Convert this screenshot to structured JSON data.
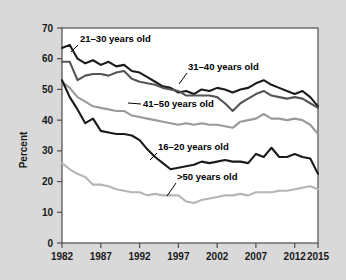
{
  "chart_data": {
    "type": "line",
    "title": "",
    "subtitle": "",
    "xlabel": "",
    "ylabel": "Percent",
    "xlim": [
      1982,
      2015
    ],
    "ylim": [
      0,
      70
    ],
    "ytick_labels": [
      "0",
      "10",
      "20",
      "30",
      "40",
      "50",
      "60",
      "70"
    ],
    "ytick_values": [
      0,
      10,
      20,
      30,
      40,
      50,
      60,
      70
    ],
    "xtick_labels": [
      "1982",
      "1987",
      "1992",
      "1997",
      "2002",
      "2007",
      "2012",
      "2015"
    ],
    "xtick_values": [
      1982,
      1987,
      1992,
      1997,
      2002,
      2007,
      2012,
      2015
    ],
    "grid": false,
    "legend": "inline-annotations",
    "x": [
      1982,
      1983,
      1984,
      1985,
      1986,
      1987,
      1988,
      1989,
      1990,
      1991,
      1992,
      1993,
      1994,
      1995,
      1996,
      1997,
      1998,
      1999,
      2000,
      2001,
      2002,
      2003,
      2004,
      2005,
      2006,
      2007,
      2008,
      2009,
      2010,
      2011,
      2012,
      2013,
      2014,
      2015
    ],
    "series": [
      {
        "name": "21-30 years old",
        "label": "21–30 years old",
        "color": "#1a1a1a",
        "values": [
          63.5,
          64.5,
          60.0,
          58.5,
          59.5,
          58.0,
          59.0,
          57.5,
          58.0,
          56.0,
          55.5,
          54.0,
          52.5,
          51.0,
          50.5,
          49.0,
          49.5,
          48.5,
          50.0,
          49.5,
          50.5,
          50.0,
          49.0,
          50.0,
          50.5,
          52.0,
          53.0,
          51.5,
          50.5,
          49.5,
          48.5,
          49.5,
          47.5,
          44.5
        ]
      },
      {
        "name": "31-40 years old",
        "label": "31–40 years old",
        "color": "#555555",
        "values": [
          59.0,
          59.0,
          53.0,
          54.5,
          55.0,
          55.0,
          54.5,
          55.5,
          56.0,
          53.5,
          52.5,
          52.0,
          51.5,
          50.5,
          50.0,
          49.5,
          48.0,
          48.0,
          48.0,
          48.0,
          47.5,
          45.5,
          43.0,
          45.5,
          47.0,
          48.5,
          49.5,
          48.0,
          47.5,
          47.0,
          47.5,
          47.0,
          45.5,
          44.0
        ]
      },
      {
        "name": "41-50 years old",
        "label": "41–50 years old",
        "color": "#9a9a9a",
        "values": [
          52.5,
          50.5,
          47.5,
          46.0,
          44.5,
          44.0,
          43.5,
          43.0,
          43.0,
          41.5,
          41.0,
          40.5,
          40.0,
          39.5,
          39.0,
          38.5,
          39.0,
          38.5,
          39.0,
          38.5,
          38.5,
          38.0,
          37.5,
          39.5,
          40.0,
          40.5,
          42.0,
          40.5,
          40.5,
          40.0,
          40.5,
          40.0,
          38.5,
          35.5
        ]
      },
      {
        "name": "16-20 years old",
        "label": "16–20 years old",
        "color": "#1a1a1a",
        "values": [
          53.0,
          47.5,
          43.5,
          39.0,
          40.5,
          36.5,
          36.0,
          35.5,
          35.5,
          35.0,
          33.5,
          30.5,
          28.0,
          26.0,
          24.0,
          24.5,
          25.0,
          25.5,
          26.5,
          26.0,
          26.5,
          27.0,
          26.5,
          26.5,
          26.0,
          29.0,
          28.0,
          31.0,
          28.0,
          28.0,
          29.0,
          28.0,
          27.5,
          22.5
        ]
      },
      {
        "name": ">50 years old",
        "label": ">50 years old",
        "color": "#b5b5b5",
        "values": [
          26.0,
          24.0,
          22.5,
          21.5,
          19.0,
          19.0,
          18.5,
          17.5,
          17.0,
          16.5,
          16.5,
          15.5,
          16.0,
          15.5,
          15.5,
          15.5,
          13.5,
          13.0,
          14.0,
          14.5,
          15.0,
          15.5,
          15.5,
          16.0,
          15.5,
          16.5,
          16.5,
          16.5,
          17.0,
          17.0,
          17.5,
          18.0,
          18.5,
          17.5
        ]
      }
    ],
    "annotations": [
      {
        "name": "annotation-21-30",
        "text": "21–30 years old",
        "text_x": 80,
        "text_y": 42,
        "leader": [
          [
            78,
            45
          ],
          [
            71,
            52
          ]
        ]
      },
      {
        "name": "annotation-31-40",
        "text": "31–40 years old",
        "text_x": 188,
        "text_y": 70,
        "leader": [
          [
            187,
            73
          ],
          [
            179,
            84
          ]
        ]
      },
      {
        "name": "annotation-41-50",
        "text": "41–50 years old",
        "text_x": 143,
        "text_y": 107,
        "leader": [
          [
            141,
            104
          ],
          [
            128,
            103
          ]
        ]
      },
      {
        "name": "annotation-16-20",
        "text": "16–20 years old",
        "text_x": 158,
        "text_y": 150,
        "leader": [
          [
            157,
            153
          ],
          [
            150,
            160
          ]
        ]
      },
      {
        "name": "annotation-gt50",
        "text": ">50 years old",
        "text_x": 177,
        "text_y": 180,
        "leader": [
          [
            176,
            183
          ],
          [
            167,
            196
          ]
        ]
      }
    ]
  },
  "figure": {
    "background_color": "#d9d9d9",
    "plot_background_color": "#ffffff",
    "axis_color": "#4d4d4d"
  }
}
